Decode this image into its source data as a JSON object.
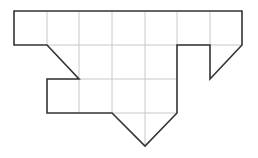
{
  "figure": {
    "colors": {
      "outline": "#333333",
      "grid": "#c8c8c8",
      "background": "#ffffff"
    },
    "outline_points": [
      [
        14,
        11
      ],
      [
        242,
        11
      ],
      [
        242,
        45
      ],
      [
        210,
        79
      ],
      [
        210,
        45
      ],
      [
        177,
        45
      ],
      [
        177,
        113
      ],
      [
        145,
        146
      ],
      [
        112,
        113
      ],
      [
        47,
        113
      ],
      [
        47,
        79
      ],
      [
        79,
        79
      ],
      [
        47,
        45
      ],
      [
        14,
        45
      ]
    ],
    "grid_lines": [
      [
        47,
        11,
        47,
        45
      ],
      [
        79,
        11,
        79,
        113
      ],
      [
        112,
        11,
        112,
        113
      ],
      [
        145,
        11,
        145,
        146
      ],
      [
        177,
        11,
        177,
        45
      ],
      [
        210,
        11,
        210,
        45
      ],
      [
        47,
        45,
        242,
        45
      ],
      [
        47,
        79,
        177,
        79
      ],
      [
        112,
        113,
        177,
        113
      ]
    ]
  }
}
